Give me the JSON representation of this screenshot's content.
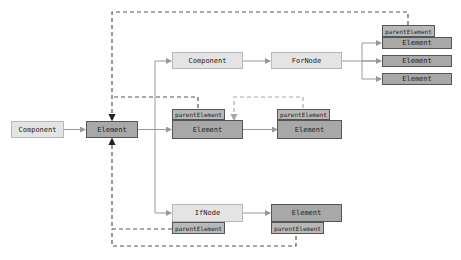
{
  "diagram": {
    "nodes": {
      "component_root": {
        "label": "Component"
      },
      "element_root": {
        "label": "Element"
      },
      "component_child": {
        "label": "Component"
      },
      "fornode": {
        "label": "ForNode"
      },
      "for_element_1": {
        "label": "Element",
        "tab": "parentElement"
      },
      "for_element_2": {
        "label": "Element"
      },
      "for_element_3": {
        "label": "Element"
      },
      "element_child": {
        "label": "Element",
        "tab": "parentElement"
      },
      "element_grandchild": {
        "label": "Element",
        "tab": "parentElement"
      },
      "ifnode": {
        "label": "IfNode",
        "tab": "parentElement"
      },
      "if_element": {
        "label": "Element",
        "tab": "parentElement"
      }
    },
    "colors": {
      "light_fill": "#e4e4e4",
      "dark_fill": "#a8a8a8",
      "tab_fill": "#b8b8b8",
      "solid_edge": "#999999",
      "dashed_edge": "#555555",
      "dashed_edge_light": "#aaaaaa"
    }
  }
}
